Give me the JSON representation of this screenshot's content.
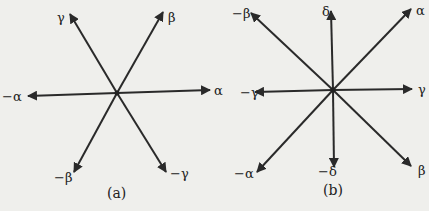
{
  "diagrams": [
    {
      "caption": "(a)",
      "center": [
        117,
        93
      ],
      "vectors": [
        {
          "label": "α",
          "tip": [
            210,
            90
          ],
          "label_pos": [
            214,
            95
          ]
        },
        {
          "label": "−α",
          "tip": [
            28,
            96
          ],
          "label_pos": [
            2,
            101
          ]
        },
        {
          "label": "β",
          "tip": [
            163,
            12
          ],
          "label_pos": [
            168,
            22
          ]
        },
        {
          "label": "−β",
          "tip": [
            74,
            172
          ],
          "label_pos": [
            54,
            182
          ]
        },
        {
          "label": "γ",
          "tip": [
            70,
            14
          ],
          "label_pos": [
            57,
            22
          ]
        },
        {
          "label": "−γ",
          "tip": [
            166,
            172
          ],
          "label_pos": [
            170,
            178
          ]
        }
      ]
    },
    {
      "caption": "(b)",
      "center": [
        333,
        90
      ],
      "vectors": [
        {
          "label": "α",
          "tip": [
            411,
            9
          ],
          "label_pos": [
            416,
            15
          ]
        },
        {
          "label": "−α",
          "tip": [
            257,
            172
          ],
          "label_pos": [
            234,
            178
          ]
        },
        {
          "label": "β",
          "tip": [
            411,
            166
          ],
          "label_pos": [
            418,
            175
          ]
        },
        {
          "label": "−β",
          "tip": [
            251,
            13
          ],
          "label_pos": [
            232,
            18
          ]
        },
        {
          "label": "γ",
          "tip": [
            412,
            89
          ],
          "label_pos": [
            418,
            94
          ]
        },
        {
          "label": "−γ",
          "tip": [
            255,
            92
          ],
          "label_pos": [
            240,
            97
          ]
        },
        {
          "label": "δ",
          "tip": [
            331,
            11
          ],
          "label_pos": [
            322,
            16
          ]
        },
        {
          "label": "−δ",
          "tip": [
            334,
            167
          ],
          "label_pos": [
            318,
            176
          ]
        }
      ]
    }
  ]
}
